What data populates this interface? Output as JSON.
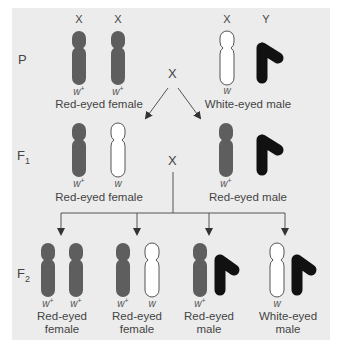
{
  "colors": {
    "background": "#ececec",
    "red_x": "#5e5e5e",
    "white_x_fill": "#ffffff",
    "white_x_stroke": "#555555",
    "y_chromosome": "#111111",
    "lines": "#555555",
    "text": "#444444"
  },
  "generations": {
    "p": {
      "label": "P",
      "female": {
        "chromosome_labels": [
          "X",
          "X"
        ],
        "alleles": [
          "w",
          "w"
        ],
        "allele_sup": [
          "+",
          "+"
        ],
        "phenotype": "Red-eyed female"
      },
      "cross_symbol": "X",
      "male": {
        "chromosome_labels": [
          "X",
          "Y"
        ],
        "alleles": [
          "w"
        ],
        "phenotype": "White-eyed male"
      }
    },
    "f1": {
      "label": "F",
      "label_sub": "1",
      "female": {
        "alleles": [
          "w",
          "w"
        ],
        "allele_sup": [
          "+",
          ""
        ],
        "phenotype": "Red-eyed female"
      },
      "cross_symbol": "X",
      "male": {
        "alleles": [
          "w"
        ],
        "allele_sup": [
          "+"
        ],
        "phenotype": "Red-eyed male"
      }
    },
    "f2": {
      "label": "F",
      "label_sub": "2",
      "offspring": [
        {
          "alleles": [
            "w",
            "w"
          ],
          "allele_sup": [
            "+",
            "+"
          ],
          "phenotype_line1": "Red-eyed",
          "phenotype_line2": "female"
        },
        {
          "alleles": [
            "w",
            "w"
          ],
          "allele_sup": [
            "+",
            ""
          ],
          "phenotype_line1": "Red-eyed",
          "phenotype_line2": "female"
        },
        {
          "alleles": [
            "w"
          ],
          "allele_sup": [
            "+"
          ],
          "phenotype_line1": "Red-eyed",
          "phenotype_line2": "male"
        },
        {
          "alleles": [
            "w"
          ],
          "allele_sup": [
            ""
          ],
          "phenotype_line1": "White-eyed",
          "phenotype_line2": "male"
        }
      ]
    }
  }
}
